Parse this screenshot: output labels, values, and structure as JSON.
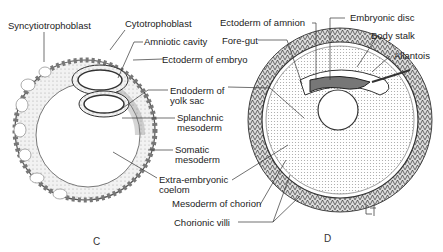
{
  "figure_c": {
    "letter": "C",
    "labels": {
      "syncytiotrophoblast": "Syncytiotrophoblast",
      "cytotrophoblast": "Cytotrophoblast",
      "amniotic_cavity": "Amniotic cavity",
      "ectoderm_of_embryo": "Ectoderm of embryo",
      "endoderm_line1": "Endoderm of",
      "endoderm_line2": "yolk sac",
      "splanchnic_line1": "Splanchnic",
      "splanchnic_line2": "mesoderm",
      "somatic_line1": "Somatic",
      "somatic_line2": "mesoderm",
      "extra_line1": "Extra-embryonic",
      "extra_line2": "coelom",
      "mesoderm_chorion": "Mesoderm of chorion",
      "chorionic_villi": "Chorionic villi"
    }
  },
  "figure_d": {
    "letter": "D",
    "signature": "LE",
    "labels": {
      "ectoderm_of_amnion": "Ectoderm of amnion",
      "embryonic_disc": "Embryonic disc",
      "fore_gut": "Fore-gut",
      "body_stalk": "Body stalk",
      "allantois": "Allantois"
    }
  }
}
